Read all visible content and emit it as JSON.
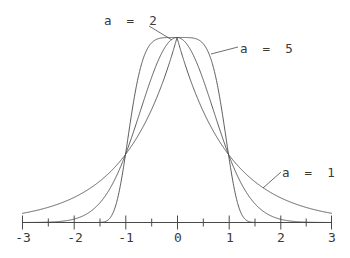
{
  "chart_data": {
    "type": "line",
    "title": "",
    "subtitle": "",
    "xlabel": "",
    "ylabel": "",
    "xlim": [
      -3,
      3
    ],
    "ylim": [
      0,
      1
    ],
    "grid": false,
    "legend_position": "inline-annotations",
    "x_major_ticks": [
      -3,
      -2,
      -1,
      0,
      1,
      2,
      3
    ],
    "x_major_tick_labels": [
      "-3",
      "-2",
      "-1",
      "0",
      "1",
      "2",
      "3"
    ],
    "x_minor_ticks": [
      -2.5,
      -1.5,
      -0.5,
      0.5,
      1.5,
      2.5
    ],
    "y_axis_visible": false,
    "formula": "exp(-|x|^a)",
    "series": [
      {
        "name": "a = 1",
        "a": 1,
        "annotation": "a  =  1",
        "x": [
          -3,
          -2.75,
          -2.5,
          -2.25,
          -2,
          -1.75,
          -1.5,
          -1.25,
          -1,
          -0.75,
          -0.5,
          -0.25,
          0,
          0.25,
          0.5,
          0.75,
          1,
          1.25,
          1.5,
          1.75,
          2,
          2.25,
          2.5,
          2.75,
          3
        ],
        "values": [
          0.0498,
          0.0639,
          0.0821,
          0.1054,
          0.1353,
          0.1738,
          0.2231,
          0.2865,
          0.3679,
          0.4724,
          0.6065,
          0.7788,
          1.0,
          0.7788,
          0.6065,
          0.4724,
          0.3679,
          0.2865,
          0.2231,
          0.1738,
          0.1353,
          0.1054,
          0.0821,
          0.0639,
          0.0498
        ]
      },
      {
        "name": "a = 2",
        "a": 2,
        "annotation": "a  =  2",
        "x": [
          -3,
          -2.75,
          -2.5,
          -2.25,
          -2,
          -1.75,
          -1.5,
          -1.25,
          -1,
          -0.75,
          -0.5,
          -0.25,
          0,
          0.25,
          0.5,
          0.75,
          1,
          1.25,
          1.5,
          1.75,
          2,
          2.25,
          2.5,
          2.75,
          3
        ],
        "values": [
          0.0001,
          0.0005,
          0.0019,
          0.0063,
          0.0183,
          0.0468,
          0.1054,
          0.2096,
          0.3679,
          0.5698,
          0.7788,
          0.9394,
          1.0,
          0.9394,
          0.7788,
          0.5698,
          0.3679,
          0.2096,
          0.1054,
          0.0468,
          0.0183,
          0.0063,
          0.0019,
          0.0005,
          0.0001
        ]
      },
      {
        "name": "a = 5",
        "a": 5,
        "annotation": "a  =  5",
        "x": [
          -3,
          -2.75,
          -2.5,
          -2.25,
          -2,
          -1.75,
          -1.5,
          -1.25,
          -1,
          -0.75,
          -0.5,
          -0.25,
          0,
          0.25,
          0.5,
          0.75,
          1,
          1.25,
          1.5,
          1.75,
          2,
          2.25,
          2.5,
          2.75,
          3
        ],
        "values": [
          0.0,
          0.0,
          0.0,
          0.0,
          0.0,
          0.0,
          0.0005,
          0.0471,
          0.3679,
          0.7899,
          0.9692,
          0.999,
          1.0,
          0.999,
          0.9692,
          0.7899,
          0.3679,
          0.0471,
          0.0005,
          0.0,
          0.0,
          0.0,
          0.0,
          0.0,
          0.0
        ]
      }
    ],
    "annotations": [
      {
        "text": "a  =  2",
        "series": "a = 2",
        "label_x": 104,
        "label_y": 13
      },
      {
        "text": "a  =  5",
        "series": "a = 5",
        "label_x": 240,
        "label_y": 41
      },
      {
        "text": "a  =  1",
        "series": "a = 1",
        "label_x": 282,
        "label_y": 165
      }
    ],
    "colors": {
      "curve": "#4a4a4a",
      "axis": "#4a4a4a",
      "text": "#3a3a3a",
      "background": "#ffffff"
    }
  }
}
